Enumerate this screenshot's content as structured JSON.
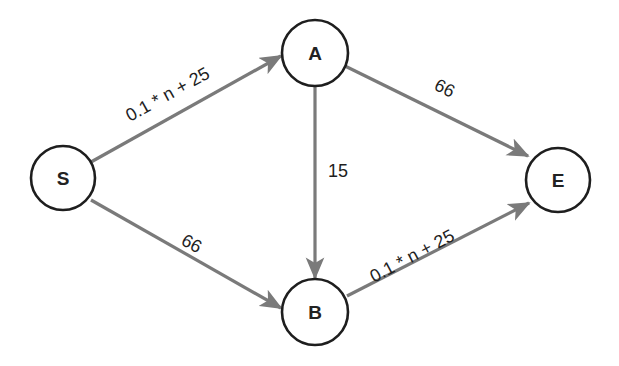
{
  "diagram": {
    "type": "directed-network-graph",
    "colors": {
      "edge": "#7a7a7a",
      "node_stroke": "#1e1e1e",
      "text": "#1e1e1e",
      "background": "#ffffff"
    },
    "nodes": [
      {
        "id": "S",
        "label": "S",
        "cx": 63,
        "cy": 178,
        "r": 32
      },
      {
        "id": "A",
        "label": "A",
        "cx": 315,
        "cy": 53,
        "r": 33
      },
      {
        "id": "B",
        "label": "B",
        "cx": 315,
        "cy": 312,
        "r": 33
      },
      {
        "id": "E",
        "label": "E",
        "cx": 558,
        "cy": 180,
        "r": 32
      }
    ],
    "edges": [
      {
        "from": "S",
        "to": "A",
        "label": "0.1 * n + 25"
      },
      {
        "from": "S",
        "to": "B",
        "label": "66"
      },
      {
        "from": "A",
        "to": "B",
        "label": "15"
      },
      {
        "from": "A",
        "to": "E",
        "label": "66"
      },
      {
        "from": "B",
        "to": "E",
        "label": "0.1 * n + 25"
      }
    ]
  }
}
